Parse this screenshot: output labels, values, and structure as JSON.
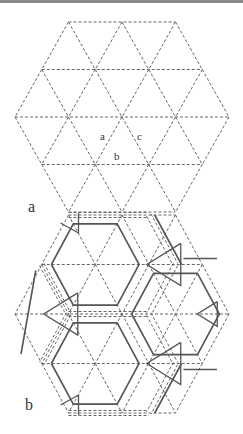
{
  "figure": {
    "panel_a": {
      "label": "a",
      "edge_labels": {
        "a": "a",
        "b": "b",
        "c": "c"
      },
      "center": [
        122,
        117
      ],
      "side": 53.5,
      "row_height": 47.5
    },
    "panel_b": {
      "label": "b",
      "center": [
        122,
        314
      ],
      "side": 53.5,
      "row_height": 49.5
    },
    "colors": {
      "dashed": "#666666",
      "solid": "#555555",
      "text": "#333333",
      "top_rule": "#8a8a8a"
    }
  }
}
